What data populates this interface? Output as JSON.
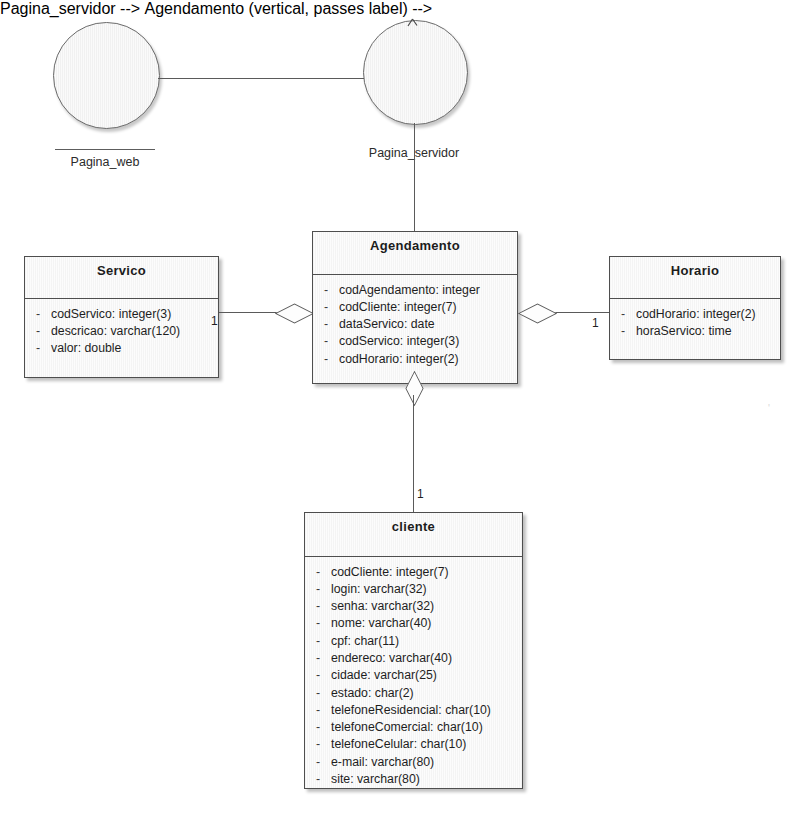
{
  "diagram": {
    "interfaces": [
      {
        "name": "Pagina_web",
        "label": "Pagina_web"
      },
      {
        "name": "Pagina_servidor",
        "label": "Pagina_servidor"
      }
    ],
    "classes": [
      {
        "id": "servico",
        "name": "Servico",
        "attributes": [
          {
            "visibility": "-",
            "text": "codServico:  integer(3)"
          },
          {
            "visibility": "-",
            "text": "descricao:  varchar(120)"
          },
          {
            "visibility": "-",
            "text": "valor:  double"
          }
        ]
      },
      {
        "id": "agendamento",
        "name": "Agendamento",
        "attributes": [
          {
            "visibility": "-",
            "text": "codAgendamento:  integer"
          },
          {
            "visibility": "-",
            "text": "codCliente:  integer(7)"
          },
          {
            "visibility": "-",
            "text": "dataServico:  date"
          },
          {
            "visibility": "-",
            "text": "codServico:  integer(3)"
          },
          {
            "visibility": "-",
            "text": "codHorario:  integer(2)"
          }
        ]
      },
      {
        "id": "horario",
        "name": "Horario",
        "attributes": [
          {
            "visibility": "-",
            "text": "codHorario:  integer(2)"
          },
          {
            "visibility": "-",
            "text": "horaServico:  time"
          }
        ]
      },
      {
        "id": "cliente",
        "name": "cliente",
        "attributes": [
          {
            "visibility": "-",
            "text": "codCliente:  integer(7)"
          },
          {
            "visibility": "-",
            "text": "login:  varchar(32)"
          },
          {
            "visibility": "-",
            "text": "senha:  varchar(32)"
          },
          {
            "visibility": "-",
            "text": "nome:  varchar(40)"
          },
          {
            "visibility": "-",
            "text": "cpf:  char(11)"
          },
          {
            "visibility": "-",
            "text": "endereco:  varchar(40)"
          },
          {
            "visibility": "-",
            "text": "cidade:  varchar(25)"
          },
          {
            "visibility": "-",
            "text": "estado:  char(2)"
          },
          {
            "visibility": "-",
            "text": "telefoneResidencial:  char(10)"
          },
          {
            "visibility": "-",
            "text": "telefoneComercial:  char(10)"
          },
          {
            "visibility": "-",
            "text": "telefoneCelular:  char(10)"
          },
          {
            "visibility": "-",
            "text": "e-mail:  varchar(80)"
          },
          {
            "visibility": "-",
            "text": "site:  varchar(80)"
          }
        ]
      }
    ],
    "associations": [
      {
        "id": "servico-agendamento",
        "multiplicity": "1",
        "kind": "aggregation"
      },
      {
        "id": "horario-agendamento",
        "multiplicity": "1",
        "kind": "aggregation"
      },
      {
        "id": "cliente-agendamento",
        "multiplicity": "1",
        "kind": "aggregation"
      }
    ],
    "colors": {
      "line": "#5a5a5a",
      "border": "#4e4e4e",
      "fill": "#fcfcfc",
      "text": "#1e1e1e"
    }
  }
}
